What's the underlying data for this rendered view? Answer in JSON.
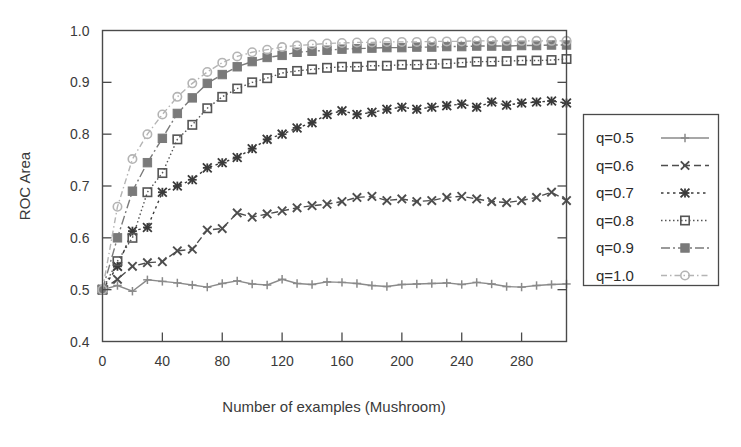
{
  "chart_data": {
    "type": "line",
    "title": "",
    "xlabel": "Number of examples (Mushroom)",
    "ylabel": "ROC Area",
    "xlim": [
      0,
      310
    ],
    "ylim": [
      0.4,
      1.0
    ],
    "xticks": [
      0,
      40,
      80,
      120,
      160,
      200,
      240,
      280
    ],
    "yticks": [
      0.4,
      0.5,
      0.6,
      0.7,
      0.8,
      0.9,
      1.0
    ],
    "xtick_labels": [
      "0",
      "40",
      "80",
      "120",
      "160",
      "200",
      "240",
      "280"
    ],
    "ytick_labels": [
      "0.4",
      "0.5",
      "0.6",
      "0.7",
      "0.8",
      "0.9",
      "1.0"
    ],
    "grid": false,
    "legend_position": "right-outside",
    "x": [
      0,
      10,
      20,
      30,
      40,
      50,
      60,
      70,
      80,
      90,
      100,
      110,
      120,
      130,
      140,
      150,
      160,
      170,
      180,
      190,
      200,
      210,
      220,
      230,
      240,
      250,
      260,
      270,
      280,
      290,
      300,
      310
    ],
    "series": [
      {
        "name": "q=0.5",
        "color": "#8a8a8a",
        "marker": "plus",
        "dash": "none",
        "values": [
          0.5,
          0.508,
          0.497,
          0.519,
          0.516,
          0.513,
          0.509,
          0.505,
          0.512,
          0.517,
          0.511,
          0.509,
          0.52,
          0.512,
          0.51,
          0.515,
          0.514,
          0.512,
          0.508,
          0.506,
          0.51,
          0.511,
          0.512,
          0.513,
          0.51,
          0.514,
          0.511,
          0.506,
          0.505,
          0.508,
          0.51,
          0.511
        ]
      },
      {
        "name": "q=0.6",
        "color": "#4d4d4d",
        "marker": "cross",
        "dash": "dashed",
        "values": [
          0.5,
          0.52,
          0.545,
          0.552,
          0.554,
          0.575,
          0.578,
          0.615,
          0.618,
          0.648,
          0.64,
          0.646,
          0.652,
          0.658,
          0.662,
          0.665,
          0.67,
          0.678,
          0.68,
          0.672,
          0.675,
          0.67,
          0.672,
          0.678,
          0.68,
          0.675,
          0.67,
          0.668,
          0.672,
          0.678,
          0.688,
          0.672
        ]
      },
      {
        "name": "q=0.7",
        "color": "#3a3a3a",
        "marker": "star",
        "dash": "dotted",
        "values": [
          0.5,
          0.545,
          0.613,
          0.62,
          0.688,
          0.7,
          0.712,
          0.735,
          0.745,
          0.755,
          0.772,
          0.79,
          0.8,
          0.812,
          0.822,
          0.838,
          0.845,
          0.838,
          0.842,
          0.848,
          0.852,
          0.848,
          0.852,
          0.855,
          0.858,
          0.852,
          0.862,
          0.856,
          0.86,
          0.862,
          0.864,
          0.86
        ]
      },
      {
        "name": "q=0.8",
        "color": "#555555",
        "marker": "square-open",
        "dash": "dotted-fine",
        "values": [
          0.5,
          0.555,
          0.6,
          0.688,
          0.725,
          0.79,
          0.818,
          0.85,
          0.872,
          0.888,
          0.9,
          0.908,
          0.918,
          0.922,
          0.925,
          0.928,
          0.93,
          0.93,
          0.932,
          0.932,
          0.934,
          0.934,
          0.935,
          0.936,
          0.938,
          0.94,
          0.94,
          0.941,
          0.942,
          0.942,
          0.943,
          0.945
        ]
      },
      {
        "name": "q=0.9",
        "color": "#7a7a7a",
        "marker": "square-filled",
        "dash": "dashdot",
        "values": [
          0.5,
          0.6,
          0.69,
          0.745,
          0.792,
          0.84,
          0.87,
          0.898,
          0.915,
          0.93,
          0.94,
          0.948,
          0.952,
          0.958,
          0.96,
          0.962,
          0.964,
          0.965,
          0.966,
          0.967,
          0.967,
          0.968,
          0.968,
          0.969,
          0.969,
          0.97,
          0.97,
          0.97,
          0.971,
          0.971,
          0.972,
          0.972
        ]
      },
      {
        "name": "q=1.0",
        "color": "#b4b4b4",
        "marker": "circle-open",
        "dash": "dashdot-fine",
        "values": [
          0.5,
          0.66,
          0.752,
          0.8,
          0.838,
          0.872,
          0.898,
          0.92,
          0.938,
          0.95,
          0.958,
          0.963,
          0.968,
          0.971,
          0.973,
          0.975,
          0.976,
          0.977,
          0.977,
          0.978,
          0.978,
          0.978,
          0.979,
          0.979,
          0.979,
          0.98,
          0.98,
          0.98,
          0.98,
          0.98,
          0.98,
          0.98
        ]
      }
    ]
  },
  "legend": {
    "items": [
      {
        "label": "q=0.5"
      },
      {
        "label": "q=0.6"
      },
      {
        "label": "q=0.7"
      },
      {
        "label": "q=0.8"
      },
      {
        "label": "q=0.9"
      },
      {
        "label": "q=1.0"
      }
    ]
  }
}
